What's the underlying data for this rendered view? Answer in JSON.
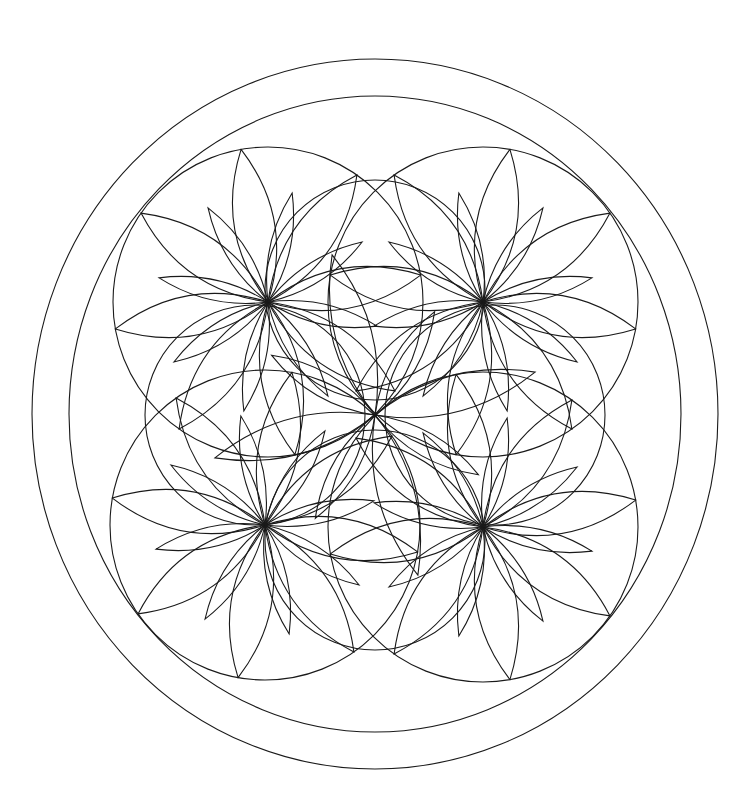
{
  "artwork": {
    "type": "mandala-coloring-page",
    "stroke_color": "#1a1a1a",
    "background": "#ffffff",
    "outer_ring": {
      "cx": 375,
      "cy": 414,
      "rx": 343,
      "ry": 355
    },
    "inner_ring": {
      "cx": 375,
      "cy": 414,
      "rx": 306,
      "ry": 318
    },
    "corner_flowers": [
      {
        "name": "top-left",
        "cx": 268,
        "cy": 302,
        "r": 155,
        "petals": 8,
        "rotation": -10
      },
      {
        "name": "top-right",
        "cx": 483,
        "cy": 302,
        "r": 155,
        "petals": 8,
        "rotation": 10
      },
      {
        "name": "bottom-left",
        "cx": 265,
        "cy": 525,
        "r": 155,
        "petals": 8,
        "rotation": 10
      },
      {
        "name": "bottom-right",
        "cx": 483,
        "cy": 527,
        "r": 155,
        "petals": 8,
        "rotation": -10
      }
    ],
    "center_flower": {
      "cx": 375,
      "cy": 415,
      "r": 195,
      "petals": 4,
      "rotation": -15
    },
    "middle_flowers": [
      {
        "name": "top",
        "cx": 375,
        "cy": 290,
        "r": 110
      },
      {
        "name": "bottom",
        "cx": 375,
        "cy": 540,
        "r": 110
      },
      {
        "name": "left",
        "cx": 255,
        "cy": 415,
        "r": 110
      },
      {
        "name": "right",
        "cx": 495,
        "cy": 415,
        "r": 110
      }
    ]
  }
}
